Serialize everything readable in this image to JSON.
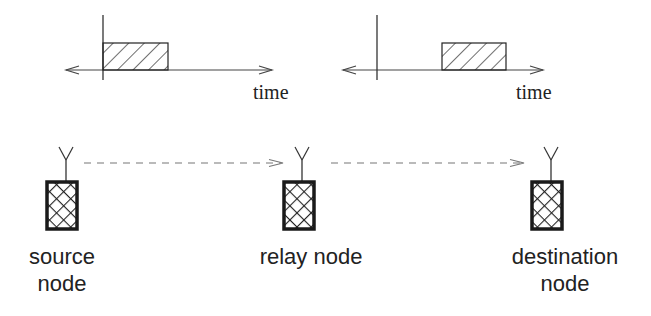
{
  "diagram": {
    "type": "relay-network",
    "colors": {
      "stroke": "#222222",
      "dash": "#777777",
      "text": "#222222"
    },
    "timelines": [
      {
        "id": "source-timeline",
        "axis_label": "time",
        "axis": {
          "x1": 66,
          "x2": 272,
          "y": 70
        },
        "origin_x": 103,
        "slot": {
          "x": 103,
          "y": 43,
          "w": 65,
          "h": 27
        },
        "label_pos": {
          "x": 253,
          "y": 99
        }
      },
      {
        "id": "relay-timeline",
        "axis_label": "time",
        "axis": {
          "x1": 343,
          "x2": 543,
          "y": 70
        },
        "origin_x": 377,
        "slot": {
          "x": 442,
          "y": 43,
          "w": 64,
          "h": 27
        },
        "label_pos": {
          "x": 516,
          "y": 99
        }
      }
    ],
    "nodes": [
      {
        "id": "source",
        "label_lines": [
          "source",
          "node"
        ],
        "box": {
          "x": 47,
          "y": 182,
          "w": 30,
          "h": 47
        },
        "antenna_x": 66,
        "label_x": 62
      },
      {
        "id": "relay",
        "label_lines": [
          "relay node"
        ],
        "box": {
          "x": 284,
          "y": 182,
          "w": 30,
          "h": 47
        },
        "antenna_x": 302,
        "label_x": 311
      },
      {
        "id": "destination",
        "label_lines": [
          "destination",
          "node"
        ],
        "box": {
          "x": 532,
          "y": 182,
          "w": 30,
          "h": 47
        },
        "antenna_x": 551,
        "label_x": 565
      }
    ],
    "links": [
      {
        "from": "source",
        "to": "relay",
        "x1": 84,
        "x2": 283,
        "y": 163,
        "style": "dashed"
      },
      {
        "from": "relay",
        "to": "destination",
        "x1": 331,
        "x2": 524,
        "y": 163,
        "style": "dashed"
      }
    ]
  }
}
